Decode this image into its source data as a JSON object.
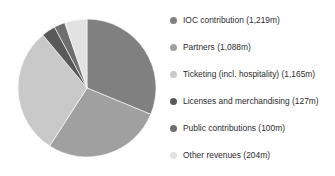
{
  "chart_data": {
    "type": "pie",
    "title": "",
    "subtitle": "",
    "xlabel": "",
    "ylabel": "",
    "unit": "m",
    "total": 3903,
    "grid": false,
    "legend_position": "right",
    "start_angle_deg": 0,
    "direction": "clockwise",
    "categories": [
      "IOC contribution",
      "Partners",
      "Ticketing (incl. hospitality)",
      "Licenses and merchandising",
      "Public contributions",
      "Other revenues"
    ],
    "values": [
      1219,
      1088,
      1165,
      127,
      100,
      204
    ],
    "colors": [
      "#808080",
      "#a0a0a0",
      "#c9c9c9",
      "#595959",
      "#6e6e6e",
      "#e2e2e2"
    ],
    "labels": [
      "IOC contribution (1,219m)",
      "Partners (1,088m)",
      "Ticketing (incl. hospitality) (1,165m)",
      "Licenses and merchandising (127m)",
      "Public contributions (100m)",
      "Other revenues (204m)"
    ]
  },
  "legend": {
    "items": [
      {
        "label": "IOC contribution (1,219m)",
        "value": 1219,
        "color": "#808080",
        "swatch_icon": "circle-icon"
      },
      {
        "label": "Partners (1,088m)",
        "value": 1088,
        "color": "#a0a0a0",
        "swatch_icon": "circle-icon"
      },
      {
        "label": "Ticketing (incl. hospitality) (1,165m)",
        "value": 1165,
        "color": "#c9c9c9",
        "swatch_icon": "circle-icon"
      },
      {
        "label": "Licenses and merchandising (127m)",
        "value": 127,
        "color": "#595959",
        "swatch_icon": "circle-icon"
      },
      {
        "label": "Public contributions (100m)",
        "value": 100,
        "color": "#6e6e6e",
        "swatch_icon": "circle-icon"
      },
      {
        "label": "Other revenues (204m)",
        "value": 204,
        "color": "#e2e2e2",
        "swatch_icon": "circle-icon"
      }
    ]
  }
}
